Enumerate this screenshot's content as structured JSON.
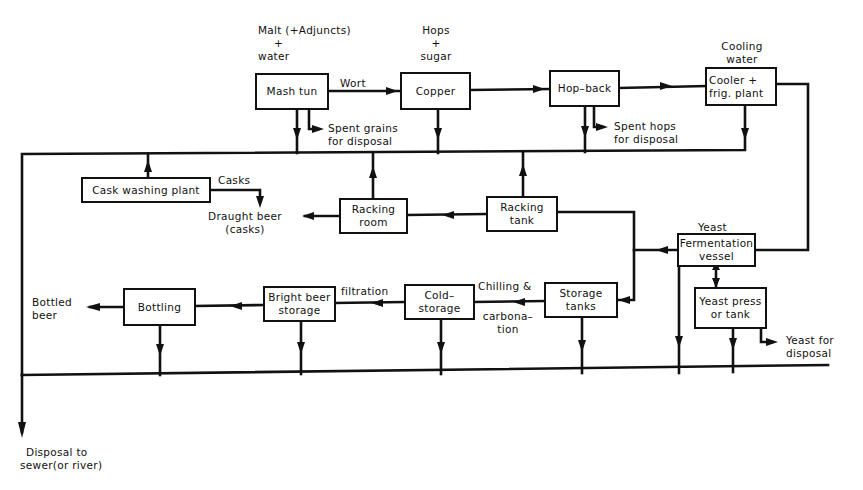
{
  "diagram": {
    "type": "process-flow",
    "title": "",
    "inputs": {
      "malt_line1": "Malt (+Adjuncts)",
      "malt_line2": "+",
      "malt_line3": "water",
      "hops_line1": "Hops",
      "hops_line2": "+",
      "hops_line3": "sugar",
      "cooling_line1": "Cooling",
      "cooling_line2": "water",
      "yeast": "Yeast"
    },
    "boxes": {
      "mash_tun": "Mash tun",
      "copper": "Copper",
      "hop_back": "Hop–back",
      "cooler_line1": "Cooler  +",
      "cooler_line2": "frig. plant",
      "cask_washing": "Cask washing plant",
      "racking_room_line1": "Racking",
      "racking_room_line2": "room",
      "racking_tank_line1": "Racking",
      "racking_tank_line2": "tank",
      "fermentation_line1": "Fermentation",
      "fermentation_line2": "vessel",
      "storage_tanks_line1": "Storage",
      "storage_tanks_line2": "tanks",
      "cold_storage_line1": "Cold–",
      "cold_storage_line2": "storage",
      "bright_beer_line1": "Bright beer",
      "bright_beer_line2": "storage",
      "bottling": "Bottling",
      "yeast_press_line1": "Yeast press",
      "yeast_press_line2": "or  tank"
    },
    "flow_labels": {
      "wort": "Wort",
      "spent_grains_line1": "Spent  grains",
      "spent_grains_line2": "for  disposal",
      "spent_hops_line1": "Spent  hops",
      "spent_hops_line2": "for  disposal",
      "casks": "Casks",
      "draught_line1": "Draught  beer",
      "draught_line2": "(casks)",
      "chilling_line1": "Chilling  &",
      "chilling_line2": "carbona–",
      "chilling_line3": "tion",
      "filtration": "filtration",
      "bottled_line1": "Bottled",
      "bottled_line2": "beer",
      "yeast_disposal_line1": "Yeast   for",
      "yeast_disposal_line2": "disposal",
      "sewer_line1": "Disposal  to",
      "sewer_line2": "sewer(or  river)"
    }
  }
}
